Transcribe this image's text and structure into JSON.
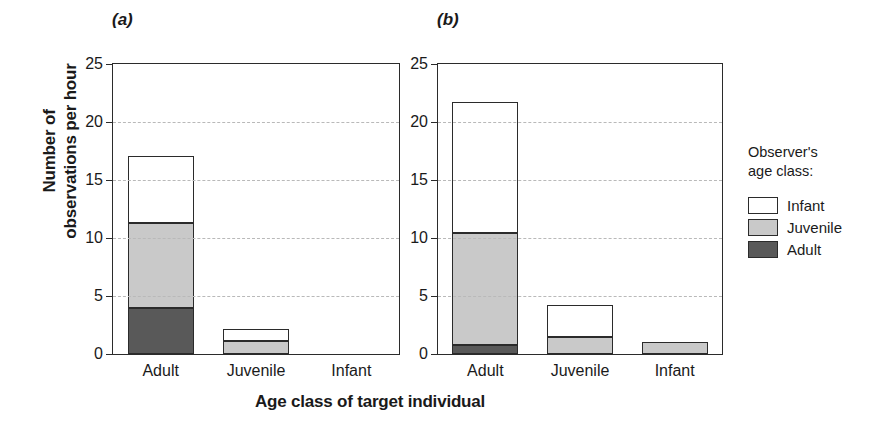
{
  "chart_data": {
    "type": "bar",
    "title": "",
    "subtype": "stacked",
    "xlabel": "Age class of target individual",
    "ylabel": "Number of observations per hour",
    "ylabel_lines": [
      "Number of",
      "observations per hour"
    ],
    "ylim": [
      0,
      25
    ],
    "yticks": [
      0,
      5,
      10,
      15,
      20,
      25
    ],
    "ytick_labels": [
      "0",
      "5",
      "10",
      "15",
      "20",
      "25"
    ],
    "grid": "horizontal-dashed",
    "categories": [
      "Adult",
      "Juvenile",
      "Infant"
    ],
    "legend": {
      "title_lines": [
        "Observer's",
        "age class:"
      ],
      "position": "right",
      "entries": [
        {
          "label": "Infant",
          "color": "#ffffff"
        },
        {
          "label": "Juvenile",
          "color": "#c9c9c9"
        },
        {
          "label": "Adult",
          "color": "#595959"
        }
      ]
    },
    "stack_order_bottom_to_top": [
      "Adult",
      "Juvenile",
      "Infant"
    ],
    "panels": [
      {
        "tag": "(a)",
        "series": [
          {
            "name": "Adult",
            "color": "#595959",
            "values": [
              4.0,
              0.0,
              0.0
            ]
          },
          {
            "name": "Juvenile",
            "color": "#c9c9c9",
            "values": [
              7.3,
              1.1,
              0.0
            ]
          },
          {
            "name": "Infant",
            "color": "#ffffff",
            "values": [
              5.8,
              1.1,
              0.0
            ]
          }
        ],
        "totals": [
          17.1,
          2.2,
          0.0
        ]
      },
      {
        "tag": "(b)",
        "series": [
          {
            "name": "Adult",
            "color": "#595959",
            "values": [
              0.8,
              0.0,
              0.0
            ]
          },
          {
            "name": "Juvenile",
            "color": "#c9c9c9",
            "values": [
              9.6,
              1.5,
              1.0
            ]
          },
          {
            "name": "Infant",
            "color": "#ffffff",
            "values": [
              11.3,
              2.7,
              0.0
            ]
          }
        ],
        "totals": [
          21.7,
          4.2,
          1.0
        ]
      }
    ]
  }
}
